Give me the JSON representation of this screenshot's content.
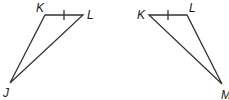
{
  "triangles": [
    {
      "name": "JKL",
      "vertices": {
        "K": "K",
        "L": "L",
        "J": "J"
      },
      "tick_side": "KL"
    },
    {
      "name": "KLM",
      "vertices": {
        "K": "K",
        "L": "L",
        "M": "M"
      },
      "tick_side": "KL"
    }
  ],
  "colors": {
    "stroke": "#333333"
  }
}
